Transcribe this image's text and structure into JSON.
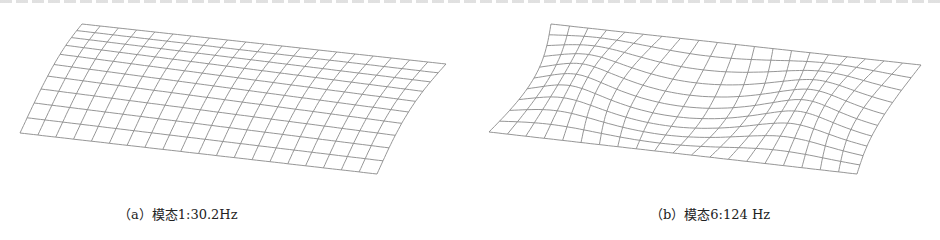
{
  "figures": [
    {
      "id": "a",
      "caption": "（a）模态1:30.2Hz",
      "mode_number": 1,
      "frequency": "30.2Hz",
      "corners": {
        "tl": [
          82,
          24
        ],
        "tr": [
          446,
          64
        ],
        "bl": [
          20,
          133
        ],
        "br": [
          377,
          174
        ]
      },
      "grid": {
        "cols": 20,
        "rows": 10
      },
      "shape": "bending"
    },
    {
      "id": "b",
      "caption": "（b）模态6:124 Hz",
      "mode_number": 6,
      "frequency": "124 Hz",
      "corners": {
        "tl": [
          551,
          24
        ],
        "tr": [
          921,
          65
        ],
        "bl": [
          489,
          132
        ],
        "br": [
          857,
          174
        ]
      },
      "grid": {
        "cols": 20,
        "rows": 10
      },
      "shape": "torsion-wave"
    }
  ],
  "colors": {
    "mesh": "#8a8a8a",
    "text": "#222222"
  }
}
